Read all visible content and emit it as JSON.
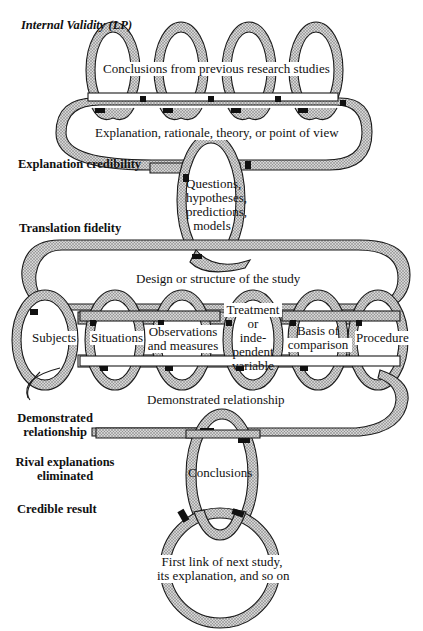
{
  "diagram": {
    "title_cutoff": "",
    "side_labels": {
      "internal_validity": "Internal Validity (LP)",
      "explanation_credibility": "Explanation credibility",
      "translation_fidelity": "Translation fidelity",
      "demonstrated_relationship_line1": "Demonstrated",
      "demonstrated_relationship_line2": "relationship",
      "rival_explanations_line1": "Rival explanations",
      "rival_explanations_line2": "eliminated",
      "credible_result": "Credible result"
    },
    "links": {
      "previous_research": "Conclusions from previous research studies",
      "explanation": "Explanation, rationale, theory, or point of view",
      "questions": [
        "Questions,",
        "hypotheses,",
        "predictions,",
        "models"
      ],
      "design": "Design or structure of the study",
      "components": [
        {
          "lines": [
            "Subjects"
          ]
        },
        {
          "lines": [
            "Situations"
          ]
        },
        {
          "lines": [
            "Observations",
            "and measures"
          ]
        },
        {
          "lines": [
            "Treatment",
            "or",
            "inde-",
            "pendent",
            "variable"
          ]
        },
        {
          "lines": [
            "Basis of",
            "comparison"
          ]
        },
        {
          "lines": [
            "Procedure"
          ]
        }
      ],
      "demonstrated_relationship": "Demonstrated relationship",
      "conclusions": "Conclusions",
      "next_study": [
        "First link of next study,",
        "its explanation, and so on"
      ]
    },
    "colors": {
      "ink": "#1a1a1a",
      "shade": "#b8b8b8",
      "dark_shade": "#111111",
      "paper": "#ffffff"
    }
  }
}
